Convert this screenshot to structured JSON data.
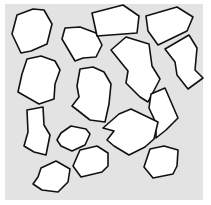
{
  "background": {
    "color": "#ffffff"
  },
  "panel": {
    "x": 5,
    "y": 4,
    "width": 198,
    "height": 196,
    "color": "#e3e3e3"
  },
  "shape_style": {
    "fill": "#ffffff",
    "stroke": "#111111",
    "stroke_width": 1.6
  },
  "shapes": [
    {
      "id": "shape-1",
      "points": "17,15 33,9 44,10 52,24 47,44 31,51 21,53 12,34"
    },
    {
      "id": "shape-2",
      "points": "62,39 65,28 80,27 96,33 102,45 96,57 83,58 75,61"
    },
    {
      "id": "shape-3",
      "points": "92,13 123,5 139,16 137,33 97,36"
    },
    {
      "id": "shape-4",
      "points": "146,16 177,7 193,17 187,31 158,45 148,31"
    },
    {
      "id": "shape-5",
      "points": "27,59 41,56 55,61 60,70 55,84 54,99 39,104 18,92 22,74"
    },
    {
      "id": "shape-6",
      "points": "80,69 93,67 104,72 111,84 109,104 105,122 90,120 76,109 72,106 79,97 77,86"
    },
    {
      "id": "shape-7",
      "points": "111,50 126,37 149,44 152,66 160,79 148,102 140,97 126,83 128,71"
    },
    {
      "id": "shape-8",
      "points": "165,49 189,35 197,48 195,70 203,78 188,89 177,75 175,62"
    },
    {
      "id": "shape-9",
      "points": "151,94 165,88 178,118 166,130 156,138 156,123 149,108"
    },
    {
      "id": "shape-10",
      "points": "27,110 43,107 44,125 50,135 46,155 34,152 24,146 28,132"
    },
    {
      "id": "shape-11",
      "points": "119,114 131,109 158,122 154,139 145,147 129,155 114,146 107,140 114,131 103,128"
    },
    {
      "id": "shape-12",
      "points": "61,133 71,126 86,129 90,134 85,145 72,151 61,146 57,140"
    },
    {
      "id": "shape-13",
      "points": "80,150 97,146 108,153 108,166 102,172 81,177 73,166"
    },
    {
      "id": "shape-14",
      "points": "150,149 164,146 178,150 177,166 173,174 153,178 144,167"
    },
    {
      "id": "shape-15",
      "points": "41,168 56,161 70,169 68,182 58,192 42,190 33,184 38,177"
    }
  ]
}
